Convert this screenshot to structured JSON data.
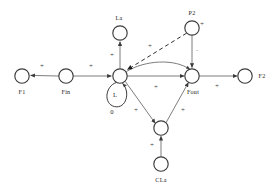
{
  "diagram": {
    "type": "signed-influence-graph",
    "nodes": [
      {
        "id": "F1",
        "label": "F1",
        "cx": 22,
        "cy": 76,
        "r": 7.2
      },
      {
        "id": "Fin",
        "label": "Fin",
        "cx": 66,
        "cy": 76,
        "r": 7.2
      },
      {
        "id": "L",
        "label": "",
        "cx": 120,
        "cy": 76,
        "r": 7.2
      },
      {
        "id": "Fout",
        "label": "Fout",
        "cx": 192,
        "cy": 76,
        "r": 7.2
      },
      {
        "id": "F2",
        "label": "F2",
        "cx": 245,
        "cy": 76,
        "r": 7.2
      },
      {
        "id": "La",
        "label": "La",
        "cx": 120,
        "cy": 33,
        "r": 7.2
      },
      {
        "id": "P2",
        "label": "P2",
        "cx": 192,
        "cy": 28,
        "r": 7.2
      },
      {
        "id": "CLmid",
        "label": "",
        "cx": 161,
        "cy": 128,
        "r": 7.2
      },
      {
        "id": "CLa",
        "label": "CLa",
        "cx": 161,
        "cy": 164,
        "r": 7.2
      }
    ],
    "node_labels": {
      "F1": "F1",
      "Fin": "Fin",
      "Fout": "Fout",
      "F2": "F2",
      "La": "La",
      "P2": "P2",
      "CLa": "CLa"
    },
    "self_loop": {
      "on_node": "L",
      "label": "L",
      "value": "0"
    },
    "edges": [
      {
        "id": "fin-f1",
        "from": "Fin",
        "to": "F1",
        "sign": "+",
        "style": "solid",
        "shape": "straight"
      },
      {
        "id": "fin-l",
        "from": "Fin",
        "to": "L",
        "sign": "+",
        "style": "solid",
        "shape": "straight"
      },
      {
        "id": "l-la",
        "from": "L",
        "to": "La",
        "sign": "+",
        "style": "solid",
        "shape": "straight"
      },
      {
        "id": "l-fout",
        "from": "L",
        "to": "Fout",
        "sign": "+",
        "style": "solid",
        "shape": "straight"
      },
      {
        "id": "l-fout-arc",
        "from": "L",
        "to": "Fout",
        "sign": "-",
        "style": "solid",
        "shape": "curved"
      },
      {
        "id": "p2-l",
        "from": "P2",
        "to": "L",
        "sign": "+",
        "style": "dashed",
        "shape": "straight"
      },
      {
        "id": "p2-fout",
        "from": "P2",
        "to": "Fout",
        "sign": "-",
        "style": "solid",
        "shape": "straight"
      },
      {
        "id": "fout-f2",
        "from": "Fout",
        "to": "F2",
        "sign": "+",
        "style": "solid",
        "shape": "straight"
      },
      {
        "id": "l-clmid",
        "from": "L",
        "to": "CLmid",
        "sign": "+",
        "style": "solid",
        "shape": "straight"
      },
      {
        "id": "clmid-fout",
        "from": "CLmid",
        "to": "Fout",
        "sign": "+",
        "style": "solid",
        "shape": "straight"
      },
      {
        "id": "cla-clmid",
        "from": "CLa",
        "to": "CLmid",
        "sign": "+",
        "style": "solid",
        "shape": "straight"
      },
      {
        "id": "p2-self",
        "from": "P2",
        "to": "P2",
        "sign": "+",
        "style": "none",
        "shape": "marker"
      }
    ],
    "sign_markers": [
      {
        "id": "sign-fin-f1",
        "text": "+",
        "x": 42,
        "y": 68
      },
      {
        "id": "sign-fin-l",
        "text": "+",
        "x": 91,
        "y": 68
      },
      {
        "id": "sign-l-la",
        "text": "+",
        "x": 112,
        "y": 57
      },
      {
        "id": "sign-p2-l",
        "text": "+",
        "x": 150,
        "y": 48
      },
      {
        "id": "sign-p2-right",
        "text": "+",
        "x": 202,
        "y": 26
      },
      {
        "id": "sign-p2-fout",
        "text": "-",
        "x": 197,
        "y": 52
      },
      {
        "id": "sign-l-fout-arc",
        "text": "-",
        "x": 168,
        "y": 64
      },
      {
        "id": "sign-l-fout",
        "text": "+",
        "x": 156,
        "y": 89
      },
      {
        "id": "sign-fout-f2",
        "text": "+",
        "x": 217,
        "y": 88
      },
      {
        "id": "sign-l-clmid",
        "text": "+",
        "x": 136,
        "y": 112
      },
      {
        "id": "sign-clmid-fout",
        "text": "+",
        "x": 183,
        "y": 112
      },
      {
        "id": "sign-cla-clmid",
        "text": "+",
        "x": 152,
        "y": 147
      }
    ],
    "colors": {
      "node_stroke": "#3b3b3b",
      "node_fill": "#ffffff",
      "edge": "#6e6e6e",
      "dashed_edge": "#2f2f2f",
      "text": "#262626",
      "background": "#ffffff"
    }
  }
}
